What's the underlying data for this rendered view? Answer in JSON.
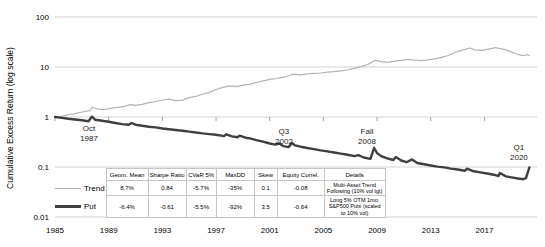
{
  "legend_table": {
    "headers": [
      "Geom. Mean",
      "Sharpe Ratio",
      "CVaR 5%",
      "MaxDD",
      "Skew",
      "Equity Correl.",
      "Details"
    ],
    "rows": [
      {
        "name": "Trend",
        "color": "#b2b2b2",
        "stats": [
          "8.7%",
          "0.84",
          "-5.7%",
          "-35%",
          "0.1",
          "-0.08"
        ],
        "details": "Multi-Asset Trend Following (10% vol tgt)"
      },
      {
        "name": "Put",
        "color": "#3f3f3f",
        "stats": [
          "-6.4%",
          "-0.61",
          "-5.5%",
          "-92%",
          "3.5",
          "-0.64"
        ],
        "details": "Long 5% OTM 1mo. S&P500 Puts (scaled to 10% vol)"
      }
    ]
  },
  "chart_data": {
    "type": "line",
    "log_scale": true,
    "title": "",
    "xlabel": "",
    "ylabel": "Cumulative Excess Return (log scale)",
    "xlim": [
      1985,
      2020.6
    ],
    "ylim": [
      0.01,
      100
    ],
    "grid": "horizontal",
    "legend_position": "bottom-left-table",
    "colors": {
      "grid": "#d2d2d2",
      "tick": "#a6a6a6",
      "text": "#000000"
    },
    "y_ticks": [
      {
        "label": "100",
        "value": 100
      },
      {
        "label": "10",
        "value": 10
      },
      {
        "label": "1",
        "value": 1
      },
      {
        "label": "0.1",
        "value": 0.1
      },
      {
        "label": "0.01",
        "value": 0.01
      }
    ],
    "x_ticks": [
      {
        "label": "1985",
        "year": 1985
      },
      {
        "label": "1989",
        "year": 1989
      },
      {
        "label": "1993",
        "year": 1993
      },
      {
        "label": "1997",
        "year": 1997
      },
      {
        "label": "2001",
        "year": 2001
      },
      {
        "label": "2005",
        "year": 2005
      },
      {
        "label": "2009",
        "year": 2009
      },
      {
        "label": "2013",
        "year": 2013
      },
      {
        "label": "2017",
        "year": 2017
      }
    ],
    "annotations": [
      {
        "text": [
          "Oct",
          "1987"
        ],
        "year": 1987.53,
        "value": 0.48
      },
      {
        "text": [
          "Q3",
          "2002"
        ],
        "year": 2002.06,
        "value": 0.42
      },
      {
        "text": [
          "Fall",
          "2008"
        ],
        "year": 2008.25,
        "value": 0.42
      },
      {
        "text": [
          "Q1",
          "2020"
        ],
        "year": 2019.57,
        "value": 0.2
      }
    ],
    "series": [
      {
        "name": "Trend",
        "color": "#b2b2b2",
        "stroke_width": 1.2,
        "points": [
          [
            1985,
            1.0
          ],
          [
            1985.3,
            0.99
          ],
          [
            1985.6,
            1.04
          ],
          [
            1986,
            1.12
          ],
          [
            1986.4,
            1.16
          ],
          [
            1986.8,
            1.22
          ],
          [
            1987.2,
            1.29
          ],
          [
            1987.6,
            1.34
          ],
          [
            1987.8,
            1.57
          ],
          [
            1988.1,
            1.46
          ],
          [
            1988.5,
            1.41
          ],
          [
            1989,
            1.46
          ],
          [
            1989.4,
            1.52
          ],
          [
            1989.8,
            1.57
          ],
          [
            1990.2,
            1.64
          ],
          [
            1990.6,
            1.77
          ],
          [
            1991,
            1.71
          ],
          [
            1991.5,
            1.79
          ],
          [
            1992,
            1.93
          ],
          [
            1992.5,
            2.04
          ],
          [
            1993,
            2.19
          ],
          [
            1993.5,
            2.27
          ],
          [
            1994,
            2.12
          ],
          [
            1994.5,
            2.18
          ],
          [
            1995,
            2.44
          ],
          [
            1995.5,
            2.6
          ],
          [
            1996,
            2.84
          ],
          [
            1996.5,
            3.1
          ],
          [
            1997,
            3.55
          ],
          [
            1997.5,
            3.9
          ],
          [
            1998,
            4.2
          ],
          [
            1998.6,
            4.05
          ],
          [
            1999,
            4.35
          ],
          [
            1999.5,
            4.5
          ],
          [
            2000,
            4.9
          ],
          [
            2000.5,
            5.3
          ],
          [
            2001,
            5.65
          ],
          [
            2001.5,
            5.9
          ],
          [
            2002,
            6.2
          ],
          [
            2002.4,
            6.7
          ],
          [
            2002.8,
            7.2
          ],
          [
            2003.3,
            6.95
          ],
          [
            2003.8,
            7.3
          ],
          [
            2004.3,
            7.45
          ],
          [
            2004.8,
            7.6
          ],
          [
            2005.3,
            7.9
          ],
          [
            2005.8,
            8.1
          ],
          [
            2006.3,
            8.4
          ],
          [
            2006.8,
            8.7
          ],
          [
            2007.3,
            9.4
          ],
          [
            2007.8,
            10.2
          ],
          [
            2008.3,
            11.2
          ],
          [
            2008.9,
            13.6
          ],
          [
            2009.3,
            12.8
          ],
          [
            2009.8,
            12.4
          ],
          [
            2010.3,
            13.1
          ],
          [
            2010.8,
            13.6
          ],
          [
            2011.3,
            14.2
          ],
          [
            2011.8,
            13.7
          ],
          [
            2012.3,
            13.4
          ],
          [
            2012.8,
            13.9
          ],
          [
            2013.3,
            14.6
          ],
          [
            2013.8,
            15.6
          ],
          [
            2014.3,
            17
          ],
          [
            2014.8,
            19.5
          ],
          [
            2015.3,
            21.5
          ],
          [
            2015.9,
            24
          ],
          [
            2016.3,
            22
          ],
          [
            2016.8,
            21.5
          ],
          [
            2017.3,
            22.8
          ],
          [
            2017.8,
            24.3
          ],
          [
            2018.2,
            23.2
          ],
          [
            2018.6,
            22
          ],
          [
            2019,
            20
          ],
          [
            2019.4,
            18.2
          ],
          [
            2019.7,
            17.2
          ],
          [
            2019.9,
            16.8
          ],
          [
            2020.1,
            17.6
          ],
          [
            2020.35,
            17
          ]
        ]
      },
      {
        "name": "Put",
        "color": "#3f3f3f",
        "stroke_width": 2.4,
        "points": [
          [
            1985,
            1.0
          ],
          [
            1985.5,
            0.96
          ],
          [
            1986,
            0.92
          ],
          [
            1986.5,
            0.89
          ],
          [
            1987,
            0.86
          ],
          [
            1987.5,
            0.82
          ],
          [
            1987.75,
            1.02
          ],
          [
            1988,
            0.88
          ],
          [
            1988.5,
            0.84
          ],
          [
            1989,
            0.8
          ],
          [
            1989.5,
            0.76
          ],
          [
            1990,
            0.72
          ],
          [
            1990.5,
            0.7
          ],
          [
            1990.7,
            0.76
          ],
          [
            1991,
            0.7
          ],
          [
            1991.5,
            0.67
          ],
          [
            1992,
            0.64
          ],
          [
            1992.5,
            0.62
          ],
          [
            1993,
            0.59
          ],
          [
            1993.5,
            0.57
          ],
          [
            1994,
            0.55
          ],
          [
            1994.5,
            0.53
          ],
          [
            1995,
            0.51
          ],
          [
            1995.5,
            0.49
          ],
          [
            1996,
            0.47
          ],
          [
            1996.5,
            0.455
          ],
          [
            1997,
            0.44
          ],
          [
            1997.6,
            0.415
          ],
          [
            1997.75,
            0.45
          ],
          [
            1998.2,
            0.41
          ],
          [
            1998.6,
            0.395
          ],
          [
            1998.75,
            0.425
          ],
          [
            1999.2,
            0.385
          ],
          [
            1999.6,
            0.37
          ],
          [
            2000,
            0.345
          ],
          [
            2000.5,
            0.32
          ],
          [
            2001,
            0.295
          ],
          [
            2001.4,
            0.28
          ],
          [
            2001.7,
            0.295
          ],
          [
            2002,
            0.262
          ],
          [
            2002.4,
            0.25
          ],
          [
            2002.65,
            0.3
          ],
          [
            2002.9,
            0.27
          ],
          [
            2003.3,
            0.255
          ],
          [
            2003.8,
            0.24
          ],
          [
            2004.3,
            0.228
          ],
          [
            2004.8,
            0.215
          ],
          [
            2005.3,
            0.205
          ],
          [
            2005.8,
            0.195
          ],
          [
            2006.3,
            0.185
          ],
          [
            2006.8,
            0.175
          ],
          [
            2007.3,
            0.165
          ],
          [
            2007.6,
            0.172
          ],
          [
            2008,
            0.155
          ],
          [
            2008.5,
            0.145
          ],
          [
            2008.78,
            0.24
          ],
          [
            2009,
            0.19
          ],
          [
            2009.3,
            0.165
          ],
          [
            2009.7,
            0.15
          ],
          [
            2010.2,
            0.138
          ],
          [
            2010.4,
            0.158
          ],
          [
            2010.8,
            0.135
          ],
          [
            2011.2,
            0.125
          ],
          [
            2011.6,
            0.142
          ],
          [
            2012,
            0.12
          ],
          [
            2012.5,
            0.113
          ],
          [
            2013,
            0.107
          ],
          [
            2013.5,
            0.102
          ],
          [
            2014,
            0.098
          ],
          [
            2014.5,
            0.093
          ],
          [
            2015,
            0.089
          ],
          [
            2015.55,
            0.084
          ],
          [
            2015.7,
            0.093
          ],
          [
            2016.2,
            0.082
          ],
          [
            2016.7,
            0.078
          ],
          [
            2017.2,
            0.074
          ],
          [
            2017.7,
            0.07
          ],
          [
            2018.05,
            0.066
          ],
          [
            2018.15,
            0.076
          ],
          [
            2018.6,
            0.065
          ],
          [
            2019,
            0.062
          ],
          [
            2019.5,
            0.059
          ],
          [
            2019.9,
            0.057
          ],
          [
            2020.1,
            0.06
          ],
          [
            2020.35,
            0.098
          ]
        ]
      }
    ]
  }
}
